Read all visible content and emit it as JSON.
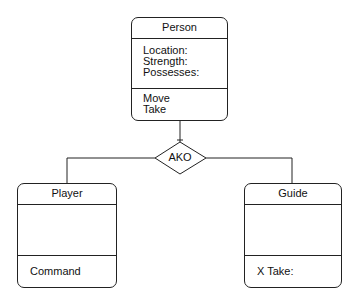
{
  "diagram": {
    "relation_label": "AKO",
    "classes": {
      "person": {
        "name": "Person",
        "attributes": [
          "Location:",
          "Strength:",
          "Possesses:"
        ],
        "methods": [
          "Move",
          "Take"
        ]
      },
      "player": {
        "name": "Player",
        "attributes": [],
        "methods": [
          "Command"
        ]
      },
      "guide": {
        "name": "Guide",
        "attributes": [],
        "methods": [
          "X Take:"
        ]
      }
    }
  }
}
